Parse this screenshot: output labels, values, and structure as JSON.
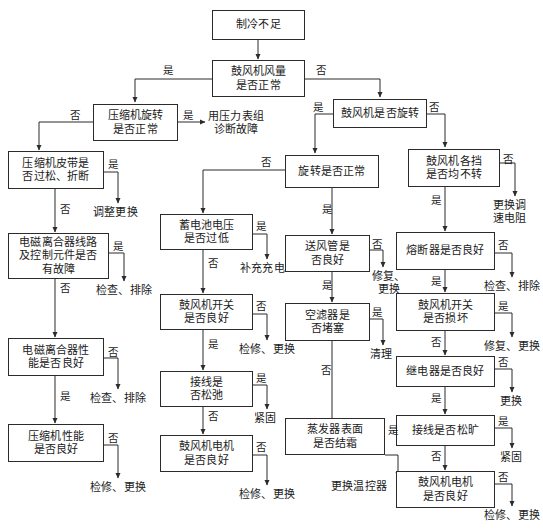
{
  "diagram": {
    "type": "flowchart",
    "yes_label": "是",
    "no_label": "否",
    "line_color": "#2b2b2b",
    "box_fill": "#ffffff"
  },
  "nodes": {
    "n_start": {
      "lines": [
        "制冷不足"
      ]
    },
    "n_blower_airflow": {
      "lines": [
        "鼓风机风量",
        "是否正常"
      ]
    },
    "n_comp_rotate": {
      "lines": [
        "压缩机旋转",
        "是否正常"
      ]
    },
    "n_comp_belt": {
      "lines": [
        "压缩机皮带是",
        "否过松、折断"
      ]
    },
    "n_clutch_circuit": {
      "lines": [
        "电磁离合器线路",
        "及控制元件是否",
        "有故障"
      ]
    },
    "n_clutch_perf": {
      "lines": [
        "电磁离合器性",
        "能是否良好"
      ]
    },
    "n_comp_perf": {
      "lines": [
        "压缩机性能",
        "是否良好"
      ]
    },
    "n_blower_spin": {
      "lines": [
        "鼓风机是否旋转"
      ]
    },
    "n_spin_normal": {
      "lines": [
        "旋转是否正常"
      ]
    },
    "n_blower_gears": {
      "lines": [
        "鼓风机各挡",
        "是否均不转"
      ]
    },
    "n_battery_volt": {
      "lines": [
        "蓄电池电压",
        "是否过低"
      ]
    },
    "n_blower_switch_ok": {
      "lines": [
        "鼓风机开关",
        "是否良好"
      ]
    },
    "n_wiring_loose_mid": {
      "lines": [
        "接线是",
        "否松弛"
      ]
    },
    "n_blower_motor_mid": {
      "lines": [
        "鼓风机电机",
        "是否良好"
      ]
    },
    "n_air_duct": {
      "lines": [
        "送风管是",
        "否良好"
      ]
    },
    "n_air_filter": {
      "lines": [
        "空滤器是",
        "否堵塞"
      ]
    },
    "n_evaporator_frost": {
      "lines": [
        "蒸发器表面",
        "是否结霜"
      ]
    },
    "n_fuse": {
      "lines": [
        "熔断器是否良好"
      ]
    },
    "n_blower_switch_damaged": {
      "lines": [
        "鼓风机开关",
        "是否损坏"
      ]
    },
    "n_relay": {
      "lines": [
        "继电器是否良好"
      ]
    },
    "n_wiring_loose_right": {
      "lines": [
        "接线是否松旷"
      ]
    },
    "n_blower_motor_right": {
      "lines": [
        "鼓风机电机",
        "是否良好"
      ]
    }
  },
  "terminals": {
    "t_pressure_gauge": {
      "lines": [
        "用压力表组",
        "诊断故障"
      ]
    },
    "t_adjust_replace": {
      "lines": [
        "调整更换"
      ]
    },
    "t_check_clear_1": {
      "lines": [
        "检查、排除"
      ]
    },
    "t_check_clear_2": {
      "lines": [
        "检查、排除"
      ]
    },
    "t_repair_replace_left": {
      "lines": [
        "检修、更换"
      ]
    },
    "t_replace_resistor": {
      "lines": [
        "更换调",
        "速电阻"
      ]
    },
    "t_recharge": {
      "lines": [
        "补充充电"
      ]
    },
    "t_repair_replace_mid1": {
      "lines": [
        "检修、更换"
      ]
    },
    "t_tighten_mid": {
      "lines": [
        "紧固"
      ]
    },
    "t_repair_replace_mid2": {
      "lines": [
        "检修、更换"
      ]
    },
    "t_fix_replace_duct": {
      "lines": [
        "修复、",
        "更换"
      ]
    },
    "t_clean": {
      "lines": [
        "清理"
      ]
    },
    "t_replace_thermostat": {
      "lines": [
        "更换温控器"
      ]
    },
    "t_check_clear_right": {
      "lines": [
        "检查、排除"
      ]
    },
    "t_fix_replace_switch": {
      "lines": [
        "修复、更换"
      ]
    },
    "t_replace_relay": {
      "lines": [
        "更换"
      ]
    },
    "t_tighten_right": {
      "lines": [
        "紧固"
      ]
    },
    "t_repair_replace_right": {
      "lines": [
        "检修、更换"
      ]
    }
  },
  "edge_labels": [
    {
      "id": "el_airflow_yes",
      "text": "是"
    },
    {
      "id": "el_airflow_no",
      "text": "否"
    },
    {
      "id": "el_comp_rotate_no",
      "text": "否"
    },
    {
      "id": "el_comp_rotate_yes",
      "text": "是"
    },
    {
      "id": "el_belt_yes",
      "text": "是"
    },
    {
      "id": "el_belt_no",
      "text": "否"
    },
    {
      "id": "el_clutch_circuit_yes",
      "text": "是"
    },
    {
      "id": "el_clutch_circuit_no",
      "text": "否"
    },
    {
      "id": "el_clutch_perf_no",
      "text": "否"
    },
    {
      "id": "el_clutch_perf_yes",
      "text": "是"
    },
    {
      "id": "el_comp_perf_no",
      "text": "否"
    },
    {
      "id": "el_blower_spin_yes",
      "text": "是"
    },
    {
      "id": "el_blower_spin_no",
      "text": "否"
    },
    {
      "id": "el_spin_normal_no",
      "text": "否"
    },
    {
      "id": "el_spin_normal_yes",
      "text": "是"
    },
    {
      "id": "el_gears_no",
      "text": "否"
    },
    {
      "id": "el_gears_yes",
      "text": "是"
    },
    {
      "id": "el_battery_yes",
      "text": "是"
    },
    {
      "id": "el_battery_no",
      "text": "否"
    },
    {
      "id": "el_switch_ok_no",
      "text": "否"
    },
    {
      "id": "el_switch_ok_yes",
      "text": "是"
    },
    {
      "id": "el_wiring_mid_yes",
      "text": "是"
    },
    {
      "id": "el_wiring_mid_no",
      "text": "否"
    },
    {
      "id": "el_motor_mid_no",
      "text": "否"
    },
    {
      "id": "el_duct_no",
      "text": "否"
    },
    {
      "id": "el_duct_yes",
      "text": "是"
    },
    {
      "id": "el_filter_yes",
      "text": "是"
    },
    {
      "id": "el_filter_no",
      "text": "否"
    },
    {
      "id": "el_evap_yes",
      "text": "是"
    },
    {
      "id": "el_fuse_no",
      "text": "否"
    },
    {
      "id": "el_fuse_yes",
      "text": "是"
    },
    {
      "id": "el_switch_dmg_yes",
      "text": "是"
    },
    {
      "id": "el_switch_dmg_no",
      "text": "否"
    },
    {
      "id": "el_relay_no",
      "text": "否"
    },
    {
      "id": "el_relay_yes",
      "text": "是"
    },
    {
      "id": "el_wiring_right_yes",
      "text": "是"
    },
    {
      "id": "el_wiring_right_no",
      "text": "否"
    },
    {
      "id": "el_motor_right_no",
      "text": "否"
    }
  ]
}
